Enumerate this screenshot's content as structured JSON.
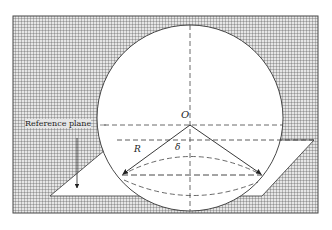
{
  "diagram": {
    "type": "geometry-sphere-on-reference-plane",
    "labels": {
      "center": "O",
      "radius": "R",
      "depth": "δ",
      "reference_plane": "Reference plane"
    },
    "colors": {
      "grid_background": "#d9d9d9",
      "grid_line": "#555555",
      "stroke": "#333333",
      "fill": "#ffffff"
    },
    "geometry": {
      "frame": {
        "x": 13,
        "y": 16,
        "width": 305,
        "height": 197
      },
      "circle": {
        "cx": 190,
        "cy": 118,
        "r": 93
      },
      "plane_polygon": [
        [
          50,
          196
        ],
        [
          117,
          140
        ],
        [
          314,
          140
        ],
        [
          262,
          196
        ]
      ],
      "chord_y": 175,
      "arrow_left_end": [
        122,
        175
      ],
      "arrow_right_end": [
        262,
        175
      ]
    }
  }
}
